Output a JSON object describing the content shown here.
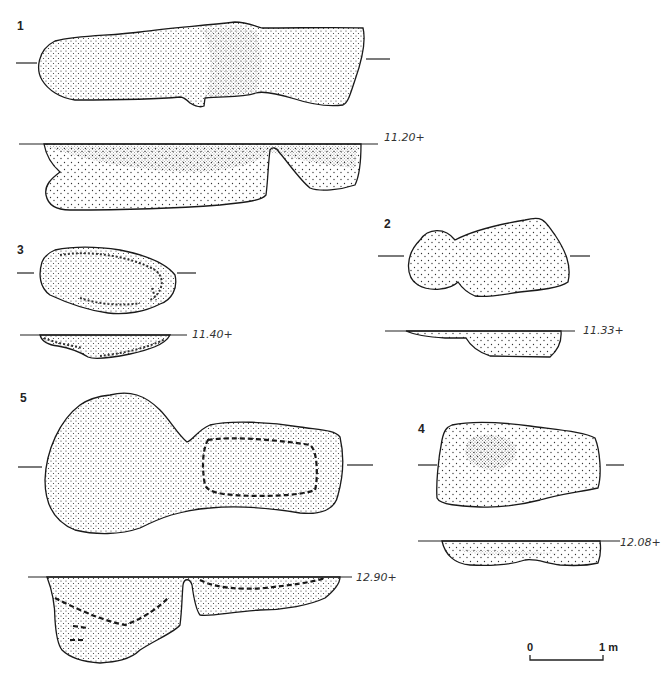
{
  "figure": {
    "type": "archaeological plans and sections of pits",
    "colors": {
      "ink": "#1a1a1a",
      "background": "#ffffff"
    }
  },
  "features": [
    {
      "id": "1",
      "label": "1",
      "elevation": "11.20+"
    },
    {
      "id": "2",
      "label": "2",
      "elevation": "11.33+"
    },
    {
      "id": "3",
      "label": "3",
      "elevation": "11.40+"
    },
    {
      "id": "4",
      "label": "4",
      "elevation": "12.08+"
    },
    {
      "id": "5",
      "label": "5",
      "elevation": "12.90+"
    }
  ],
  "scale_bar": {
    "start": "0",
    "end": "1 m"
  }
}
